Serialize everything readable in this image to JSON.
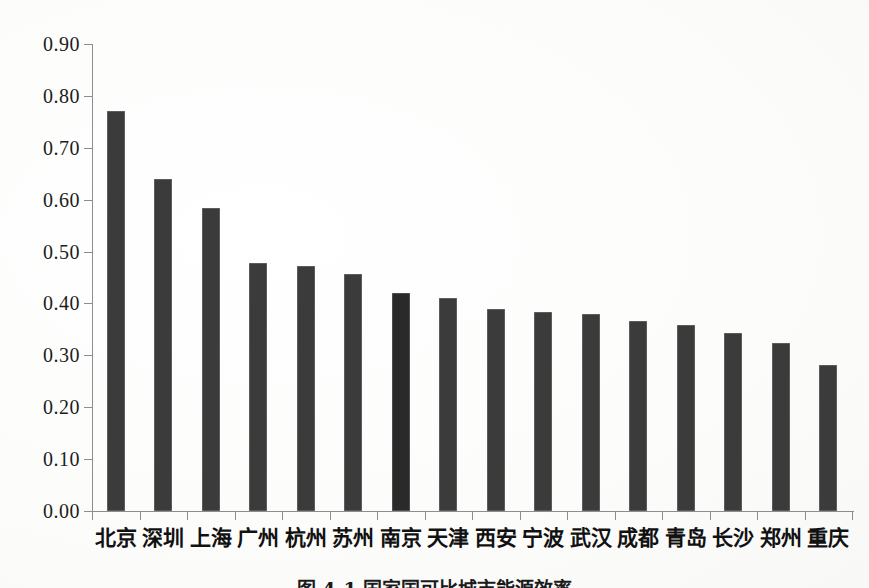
{
  "chart_data": {
    "type": "bar",
    "title": "",
    "xlabel": "",
    "ylabel": "",
    "ylim": [
      0.0,
      0.9
    ],
    "ytick_step": 0.1,
    "ytick_labels": [
      "0.90",
      "0.80",
      "0.70",
      "0.60",
      "0.50",
      "0.40",
      "0.30",
      "0.20",
      "0.10",
      "0.00"
    ],
    "grid": false,
    "legend": "none",
    "categories": [
      "北京",
      "深圳",
      "上海",
      "广州",
      "杭州",
      "苏州",
      "南京",
      "天津",
      "西安",
      "宁波",
      "武汉",
      "成都",
      "青岛",
      "长沙",
      "郑州",
      "重庆"
    ],
    "values": [
      0.77,
      0.64,
      0.584,
      0.478,
      0.472,
      0.457,
      0.42,
      0.41,
      0.39,
      0.384,
      0.38,
      0.366,
      0.358,
      0.343,
      0.323,
      0.281
    ],
    "highlight_index": 6,
    "bar_color": "#3b3b3b",
    "highlight_color": "#2a2a2a",
    "axis_color": "#8d8d8d"
  },
  "caption": {
    "text": "图 4-1  国家国可比城市能源效率"
  }
}
